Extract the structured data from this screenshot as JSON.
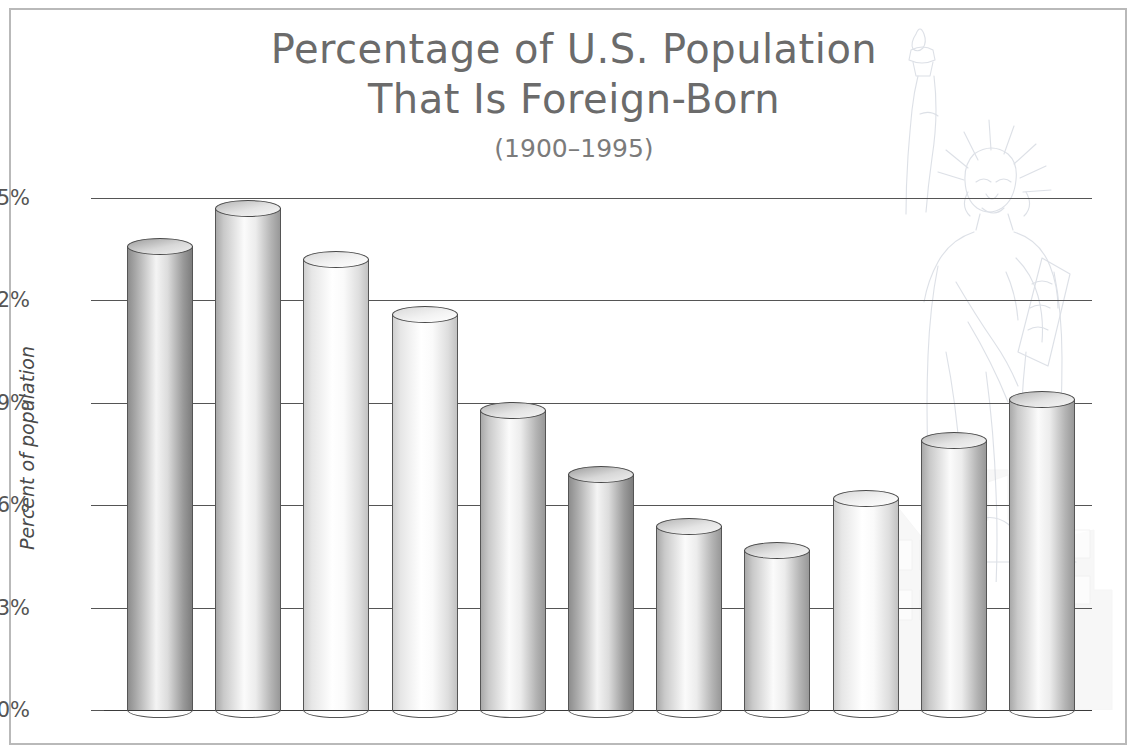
{
  "chart_data": {
    "type": "bar",
    "title": "Percentage of U.S. Population That Is Foreign-Born",
    "title_lines": [
      "Percentage of U.S. Population",
      "That Is Foreign-Born"
    ],
    "subtitle": "(1900–1995)",
    "xlabel": "",
    "ylabel": "Percent of population",
    "categories": [
      "1900",
      "1910",
      "1920",
      "1930",
      "1940",
      "1950",
      "1960",
      "1970",
      "1980",
      "1990",
      "1995"
    ],
    "values": [
      13.6,
      14.7,
      13.2,
      11.6,
      8.8,
      6.9,
      5.4,
      4.7,
      6.2,
      7.9,
      9.1
    ],
    "ylim": [
      0,
      15
    ],
    "ytick_values": [
      0,
      3,
      6,
      9,
      12,
      15
    ],
    "ytick_labels": [
      "0%",
      "3%",
      "6%",
      "9%",
      "12%",
      "15%"
    ],
    "grid": true,
    "legend": null,
    "bar_style": "3d-cylinder",
    "bar_shades": [
      {
        "year": "1900",
        "tone": "dark"
      },
      {
        "year": "1910",
        "tone": "medium"
      },
      {
        "year": "1920",
        "tone": "light"
      },
      {
        "year": "1930",
        "tone": "light"
      },
      {
        "year": "1940",
        "tone": "medium"
      },
      {
        "year": "1950",
        "tone": "dark"
      },
      {
        "year": "1960",
        "tone": "medium"
      },
      {
        "year": "1970",
        "tone": "medium"
      },
      {
        "year": "1980",
        "tone": "light"
      },
      {
        "year": "1990",
        "tone": "medium"
      },
      {
        "year": "1995",
        "tone": "medium"
      }
    ]
  },
  "colors": {
    "title_text": "#6b6b6b",
    "subtitle_text": "#7b7b7b",
    "axis_text": "#555555",
    "gridline": "#555555",
    "frame": "#b9b9b9",
    "background": "#ffffff"
  },
  "decor": {
    "watermark": "statue-of-liberty-line-art",
    "skyline": "city-skyline-line-art"
  }
}
